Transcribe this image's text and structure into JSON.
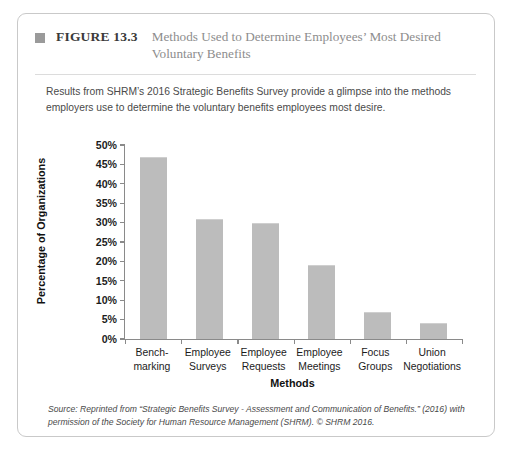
{
  "figure": {
    "marker_icon": "square-marker-icon",
    "label": "FIGURE 13.3",
    "title": "Methods Used to Determine Employees’ Most Desired Voluntary Benefits",
    "subtitle": "Results from SHRM’s 2016 Strategic Benefits Survey provide a glimpse into the methods employers use to determine the voluntary benefits employees most desire.",
    "source": "Source: Reprinted from “Strategic Benefits Survey - Assessment and Communication of Benefits.” (2016) with permission of the Society for Human Resource Management (SHRM). © SHRM 2016.",
    "border_color": "#c9c9c9",
    "marker_color": "#9a9a9a"
  },
  "chart_data": {
    "type": "bar",
    "title": "Methods Used to Determine Employees’ Most Desired Voluntary Benefits",
    "categories": [
      "Bench-\nmarking",
      "Employee\nSurveys",
      "Employee\nRequests",
      "Employee\nMeetings",
      "Focus\nGroups",
      "Union\nNegotiations"
    ],
    "values": [
      47,
      31,
      30,
      19,
      7,
      4
    ],
    "xlabel": "Methods",
    "ylabel": "Percentage of Organizations",
    "ylim": [
      0,
      50
    ],
    "ytick_step": 5,
    "ytick_labels": [
      "0%",
      "5%",
      "10%",
      "15%",
      "20%",
      "25%",
      "30%",
      "35%",
      "40%",
      "45%",
      "50%"
    ],
    "grid": false,
    "legend": false,
    "bar_color": "#bcbcbc",
    "axis_color": "#8a8a8a"
  }
}
